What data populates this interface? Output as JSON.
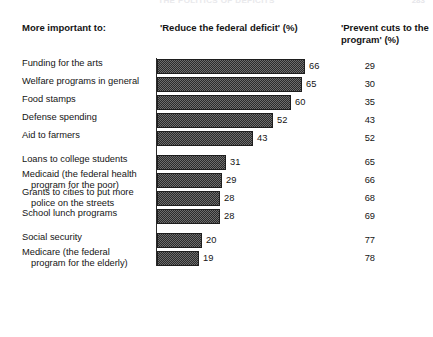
{
  "running_head": {
    "center": "THE POLITICS OF DEFICITS",
    "right": "283"
  },
  "header": {
    "left_label": "More important to:",
    "middle_label": "'Reduce the federal deficit' (%)",
    "right_label": "'Prevent cuts to the program' (%)"
  },
  "chart_data": {
    "type": "bar",
    "orientation": "horizontal",
    "title": "",
    "xlabel": "",
    "ylabel": "",
    "xlim": [
      0,
      100
    ],
    "grid": false,
    "legend": "none",
    "categories": [
      "Funding for the arts",
      "Welfare programs in general",
      "Food stamps",
      "Defense spending",
      "Aid to farmers",
      "Loans to college students",
      "Medicaid (the federal health program for the poor)",
      "Grants to cities to put more police on the streets",
      "School lunch programs",
      "Social security",
      "Medicare (the federal program for the elderly)"
    ],
    "series": [
      {
        "name": "'Reduce the federal deficit' (%)",
        "values": [
          66,
          65,
          60,
          52,
          43,
          31,
          29,
          28,
          28,
          20,
          19
        ]
      },
      {
        "name": "'Prevent cuts to the program' (%)",
        "values": [
          29,
          30,
          35,
          43,
          52,
          65,
          66,
          68,
          69,
          77,
          78
        ]
      }
    ]
  },
  "rows": [
    {
      "label_line1": "Funding for the arts",
      "label_line2": "",
      "bar": 66,
      "bar_text": "66",
      "right_text": "29",
      "group": 1
    },
    {
      "label_line1": "Welfare programs in general",
      "label_line2": "",
      "bar": 65,
      "bar_text": "65",
      "right_text": "30",
      "group": 1
    },
    {
      "label_line1": "Food stamps",
      "label_line2": "",
      "bar": 60,
      "bar_text": "60",
      "right_text": "35",
      "group": 1
    },
    {
      "label_line1": "Defense spending",
      "label_line2": "",
      "bar": 52,
      "bar_text": "52",
      "right_text": "43",
      "group": 1
    },
    {
      "label_line1": "Aid to farmers",
      "label_line2": "",
      "bar": 43,
      "bar_text": "43",
      "right_text": "52",
      "group": 1
    },
    {
      "label_line1": "Loans to college students",
      "label_line2": "",
      "bar": 31,
      "bar_text": "31",
      "right_text": "65",
      "group": 2
    },
    {
      "label_line1": "Medicaid (the federal health",
      "label_line2": "program for the poor)",
      "bar": 29,
      "bar_text": "29",
      "right_text": "66",
      "group": 2
    },
    {
      "label_line1": "Grants to cities to put more",
      "label_line2": "police on the streets",
      "bar": 28,
      "bar_text": "28",
      "right_text": "68",
      "group": 2
    },
    {
      "label_line1": "School lunch programs",
      "label_line2": "",
      "bar": 28,
      "bar_text": "28",
      "right_text": "69",
      "group": 2
    },
    {
      "label_line1": "Social security",
      "label_line2": "",
      "bar": 20,
      "bar_text": "20",
      "right_text": "77",
      "group": 3
    },
    {
      "label_line1": "Medicare (the federal",
      "label_line2": "program for the elderly)",
      "bar": 19,
      "bar_text": "19",
      "right_text": "78",
      "group": 3
    }
  ]
}
